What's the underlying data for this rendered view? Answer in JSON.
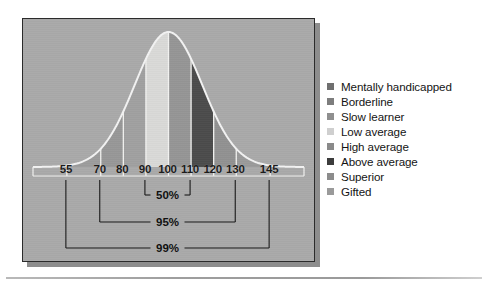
{
  "figure": {
    "panel_bg": "#a9a9a9",
    "border_color": "#2b2b2b"
  },
  "chart_data": {
    "type": "area",
    "title": "",
    "subtitle": "",
    "xlabel": "",
    "ylabel": "",
    "grid": false,
    "legend_position": "right",
    "distribution": {
      "name": "IQ normal distribution",
      "mean": 100,
      "sd": 15,
      "curve_color": "#f2f2f2"
    },
    "xlim": [
      40,
      160
    ],
    "tick_labels": [
      "55",
      "70",
      "80",
      "90",
      "100",
      "110",
      "120",
      "130",
      "145"
    ],
    "tick_values": [
      55,
      70,
      80,
      90,
      100,
      110,
      120,
      130,
      145
    ],
    "bands": [
      {
        "label": "Mentally handicapped",
        "from": 40,
        "to": 55,
        "color": "#f6f6f4"
      },
      {
        "label": "Borderline",
        "from": 55,
        "to": 70,
        "color": "#9c9c9c"
      },
      {
        "label": "Slow learner",
        "from": 70,
        "to": 80,
        "color": "#979797"
      },
      {
        "label": "Low average",
        "from": 80,
        "to": 90,
        "color": "#a0a0a0"
      },
      {
        "label": "Low average ",
        "from": 90,
        "to": 100,
        "color": "#d9d9d7"
      },
      {
        "label": "High average",
        "from": 100,
        "to": 110,
        "color": "#959595"
      },
      {
        "label": "Above average",
        "from": 110,
        "to": 120,
        "color": "#4b4b4b"
      },
      {
        "label": "Superior",
        "from": 120,
        "to": 130,
        "color": "#919191"
      },
      {
        "label": "Gifted",
        "from": 130,
        "to": 145,
        "color": "#9a9a9a"
      },
      {
        "label": "Gifted ",
        "from": 145,
        "to": 160,
        "color": "#f6f6f4"
      }
    ],
    "annotations": [
      {
        "label": "50%",
        "from": 90,
        "to": 110,
        "row": 0
      },
      {
        "label": "95%",
        "from": 70,
        "to": 130,
        "row": 1
      },
      {
        "label": "99%",
        "from": 55,
        "to": 145,
        "row": 2
      }
    ],
    "legend": [
      {
        "label": "Mentally handicapped",
        "color": "#6f6f6f"
      },
      {
        "label": "Borderline",
        "color": "#7d7d7d"
      },
      {
        "label": "Slow learner",
        "color": "#8f8f8f"
      },
      {
        "label": "Low average",
        "color": "#cfcfcf"
      },
      {
        "label": "High average",
        "color": "#8a8a8a"
      },
      {
        "label": "Above average",
        "color": "#3c3c3c"
      },
      {
        "label": "Superior",
        "color": "#8c8c8c"
      },
      {
        "label": "Gifted",
        "color": "#9a9a9a"
      }
    ]
  }
}
